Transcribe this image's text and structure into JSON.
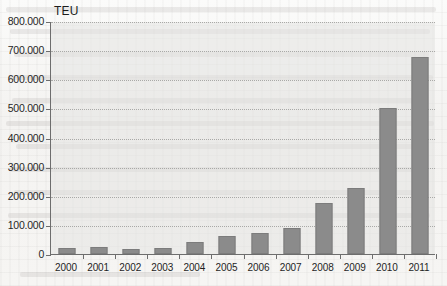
{
  "chart_data": {
    "type": "bar",
    "title": "",
    "unit_label": "TEU",
    "xlabel": "",
    "ylabel": "TEU",
    "ylim": [
      0,
      800000
    ],
    "ytick_step": 100000,
    "grid": true,
    "legend": "none",
    "bar_color": "#8b8b8b",
    "plot_background": "#e4e4e2",
    "axis_color": "#6d6d6d",
    "categories": [
      "2000",
      "2001",
      "2002",
      "2003",
      "2004",
      "2005",
      "2006",
      "2007",
      "2008",
      "2009",
      "2010",
      "2011"
    ],
    "values": [
      20000,
      25000,
      18000,
      20000,
      40000,
      62000,
      72000,
      90000,
      175000,
      225000,
      500000,
      678000
    ],
    "ytick_labels": [
      "800.000",
      "700.000",
      "600.000",
      "500.000",
      "400.000",
      "300.000",
      "200.000",
      "100.000",
      "0"
    ],
    "ytick_values": [
      800000,
      700000,
      600000,
      500000,
      400000,
      300000,
      200000,
      100000,
      0
    ]
  },
  "page": {
    "background_note": "scanned page with bleed-through text"
  }
}
